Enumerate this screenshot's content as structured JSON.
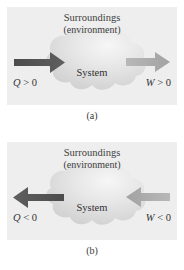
{
  "figure": {
    "colors": {
      "panel_background": "#eeeeee",
      "cloud_fill_light": "#f2f2f2",
      "cloud_fill_dark": "#c9c9c9",
      "arrow_dark": "#555555",
      "arrow_light": "#adadad",
      "text": "#3a3a3a",
      "page_background": "#ffffff"
    },
    "panels": [
      {
        "id": "a",
        "caption": "(a)",
        "surroundings_line1": "Surroundings",
        "surroundings_line2": "(environment)",
        "system_label": "System",
        "heat": {
          "label_symbol": "Q",
          "label_operator": ">",
          "label_value": "0",
          "label_full": "Q > 0",
          "direction": "into-system",
          "arrow_points": "right",
          "color": "#555555"
        },
        "work": {
          "label_symbol": "W",
          "label_operator": ">",
          "label_value": "0",
          "label_full": "W > 0",
          "direction": "out-of-system",
          "arrow_points": "right",
          "color": "#adadad"
        }
      },
      {
        "id": "b",
        "caption": "(b)",
        "surroundings_line1": "Surroundings",
        "surroundings_line2": "(environment)",
        "system_label": "System",
        "heat": {
          "label_symbol": "Q",
          "label_operator": "<",
          "label_value": "0",
          "label_full": "Q < 0",
          "direction": "out-of-system",
          "arrow_points": "left",
          "color": "#555555"
        },
        "work": {
          "label_symbol": "W",
          "label_operator": "<",
          "label_value": "0",
          "label_full": "W < 0",
          "direction": "into-system",
          "arrow_points": "left",
          "color": "#adadad"
        }
      }
    ]
  }
}
